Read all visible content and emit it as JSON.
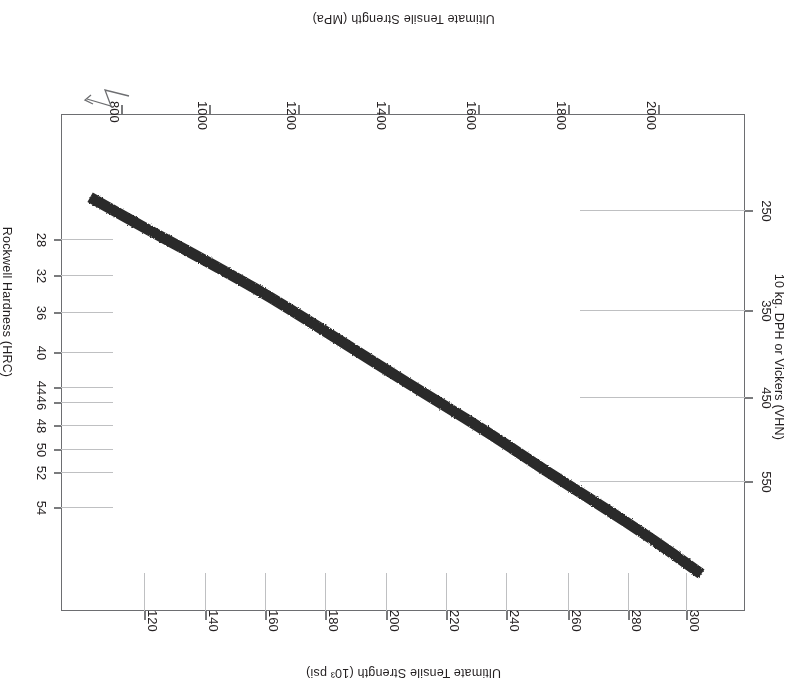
{
  "chart_data": {
    "type": "line",
    "title": "",
    "orientation_note": "figure rendered rotated 180 degrees (upside down scan)",
    "axes": {
      "bottom": {
        "name": "bottom-axis",
        "label": "Ultimate Tensile Strength (MPa)",
        "ticks": [
          2000,
          1800,
          1600,
          1400,
          1200,
          1000,
          800
        ],
        "tick_labels": [
          "2000",
          "1800",
          "1600",
          "1400",
          "1200",
          "1000",
          "800"
        ],
        "range": [
          2150,
          740
        ],
        "has_break": true
      },
      "top": {
        "name": "top-axis",
        "label": "Ultimate Tensile Strength (10³ psi)",
        "ticks": [
          300,
          280,
          260,
          240,
          220,
          200,
          180,
          160,
          140,
          120
        ],
        "tick_labels": [
          "300",
          "280",
          "260",
          "240",
          "220",
          "200",
          "180",
          "160",
          "140",
          "120"
        ],
        "range": [
          312,
          107
        ]
      },
      "left": {
        "name": "left-axis",
        "label": "10 kg. DPH or Vickers (VHN)",
        "ticks": [
          550,
          450,
          350,
          250
        ],
        "tick_labels": [
          "550",
          "450",
          "350",
          "250"
        ],
        "range": [
          610,
          180
        ]
      },
      "right": {
        "name": "right-axis",
        "label": "Rockwell Hardness (HRC)",
        "ticks": [
          54,
          52,
          50,
          48,
          46,
          44,
          40,
          36,
          32,
          28
        ],
        "tick_labels": [
          "54",
          "52",
          "50",
          "48",
          "46",
          "44",
          "40",
          "36",
          "32",
          "28"
        ]
      }
    },
    "series": [
      {
        "name": "hardness-vs-tensile-strength-band",
        "style": "thick dark band",
        "color": "#2b2b2b",
        "band_thickness_px": 11,
        "x": [
          2060,
          1960,
          1850,
          1740,
          1630,
          1510,
          1390,
          1270,
          1150,
          1030,
          910,
          800
        ],
        "y": [
          578,
          548,
          518,
          489,
          458,
          427,
          396,
          364,
          333,
          305,
          278,
          252
        ],
        "xlabel": "Ultimate Tensile Strength (MPa)",
        "ylabel": "10 kg. DPH or Vickers (VHN)"
      }
    ],
    "grid": true,
    "legend": null
  },
  "bottom_axis": {
    "label": "Ultimate Tensile Strength (MPa)",
    "ticks": [
      {
        "text": "2000",
        "x": 148
      },
      {
        "text": "1800",
        "x": 238
      },
      {
        "text": "1600",
        "x": 328
      },
      {
        "text": "1400",
        "x": 418
      },
      {
        "text": "1200",
        "x": 508
      },
      {
        "text": "1000",
        "x": 597
      },
      {
        "text": "800",
        "x": 685
      }
    ]
  },
  "top_axis": {
    "label": "Ultimate Tensile Strength (10³ psi)",
    "ticks": [
      {
        "text": "300",
        "x": 120
      },
      {
        "text": "280",
        "x": 178
      },
      {
        "text": "260",
        "x": 238
      },
      {
        "text": "240",
        "x": 300
      },
      {
        "text": "220",
        "x": 360
      },
      {
        "text": "200",
        "x": 420
      },
      {
        "text": "180",
        "x": 481
      },
      {
        "text": "160",
        "x": 541
      },
      {
        "text": "140",
        "x": 601
      },
      {
        "text": "120",
        "x": 662
      }
    ]
  },
  "left_axis": {
    "label": "10 kg. DPH or Vickers (VHN)",
    "ticks": [
      {
        "text": "550",
        "y": 206
      },
      {
        "text": "450",
        "y": 290
      },
      {
        "text": "350",
        "y": 377
      },
      {
        "text": "250",
        "y": 477
      }
    ]
  },
  "right_axis": {
    "label": "Rockwell Hardness (HRC)",
    "ticks": [
      {
        "text": "54",
        "y": 180
      },
      {
        "text": "52",
        "y": 215
      },
      {
        "text": "50",
        "y": 238
      },
      {
        "text": "48",
        "y": 262
      },
      {
        "text": "46",
        "y": 285
      },
      {
        "text": "44",
        "y": 300
      },
      {
        "text": "40",
        "y": 335
      },
      {
        "text": "36",
        "y": 375
      },
      {
        "text": "32",
        "y": 412
      },
      {
        "text": "28",
        "y": 448
      }
    ]
  },
  "colors": {
    "curve": "#2b2b2b",
    "frame": "#6d6e71",
    "grid": "#bfc0c2",
    "text": "#231f20",
    "background": "#ffffff"
  }
}
